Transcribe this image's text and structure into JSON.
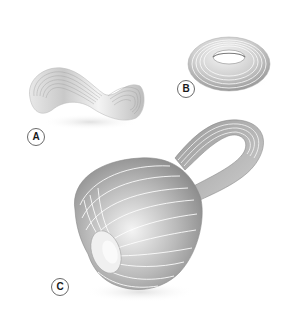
{
  "figure": {
    "shapes": [
      {
        "id": "A",
        "label": "A",
        "name": "mobius-strip",
        "description": "Möbius strip with fine grey bands"
      },
      {
        "id": "B",
        "label": "B",
        "name": "torus",
        "description": "Torus with concentric grey bands"
      },
      {
        "id": "C",
        "label": "C",
        "name": "klein-bottle",
        "description": "Klein bottle with white meridian lines"
      }
    ],
    "colors": {
      "background": "#ffffff",
      "surface_light": "#f2f2f2",
      "surface_mid": "#bdbdbd",
      "surface_dark": "#7a7a7a",
      "band_line": "#ffffff",
      "label_border": "#6a6a6a",
      "label_text": "#1a1a1a"
    }
  }
}
